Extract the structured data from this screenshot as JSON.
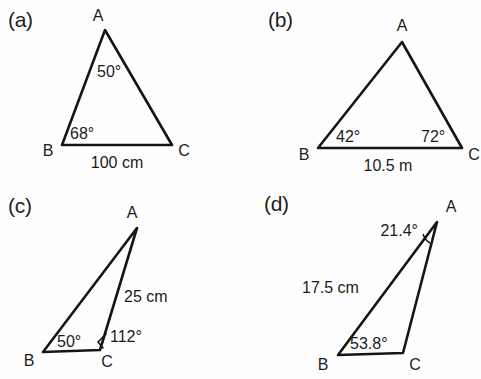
{
  "figure": {
    "background_color": "#fefefe",
    "stroke_color": "#151515",
    "text_color": "#1b1b1b",
    "panels": [
      {
        "key": "a",
        "label": "(a)",
        "vertices": {
          "A": "A",
          "B": "B",
          "C": "C"
        },
        "angles": [
          {
            "at": "A",
            "value": "50°"
          },
          {
            "at": "B",
            "value": "68°"
          }
        ],
        "sides": [
          {
            "between": "BC",
            "value": "100 cm"
          }
        ]
      },
      {
        "key": "b",
        "label": "(b)",
        "vertices": {
          "A": "A",
          "B": "B",
          "C": "C"
        },
        "angles": [
          {
            "at": "B",
            "value": "42°"
          },
          {
            "at": "C",
            "value": "72°"
          }
        ],
        "sides": [
          {
            "between": "BC",
            "value": "10.5 m"
          }
        ]
      },
      {
        "key": "c",
        "label": "(c)",
        "vertices": {
          "A": "A",
          "B": "B",
          "C": "C"
        },
        "angles": [
          {
            "at": "B",
            "value": "50°"
          },
          {
            "at": "C",
            "value": "112°"
          }
        ],
        "sides": [
          {
            "between": "AC",
            "value": "25 cm"
          }
        ]
      },
      {
        "key": "d",
        "label": "(d)",
        "vertices": {
          "A": "A",
          "B": "B",
          "C": "C"
        },
        "angles": [
          {
            "at": "A",
            "value": "21.4°"
          },
          {
            "at": "B",
            "value": "53.8°"
          }
        ],
        "sides": [
          {
            "between": "AB",
            "value": "17.5 cm"
          }
        ]
      }
    ]
  }
}
